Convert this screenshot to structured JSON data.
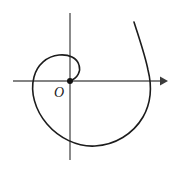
{
  "figure": {
    "background_color": "#ffffff",
    "width": 174,
    "height": 173,
    "origin_label": "O",
    "origin_label_color": "#1a1a1a",
    "curve_color": "#1c1c1c",
    "axis_color": "#5a5a5a",
    "arrow_color": "#3c3c3c"
  },
  "chart_data": {
    "type": "line",
    "xlabel": "",
    "ylabel": "",
    "grid": false,
    "legend": null,
    "origin": {
      "label": "O",
      "x_px": 70,
      "y_px": 81,
      "marker": "filled-dot",
      "marker_radius_px": 3
    },
    "axes": [
      {
        "name": "x-axis",
        "orientation": "horizontal",
        "y_px": 81,
        "x_start_px": 13,
        "x_end_px": 168,
        "arrowhead": "right-end"
      },
      {
        "name": "y-axis",
        "orientation": "vertical",
        "x_px": 70,
        "y_start_px": 13,
        "y_end_px": 160,
        "arrowhead": "none"
      }
    ],
    "series": [
      {
        "name": "spiral",
        "equation": "r = a*theta",
        "direction": "counterclockwise",
        "turns": 1.6,
        "start_point_px": [
          70,
          81
        ],
        "end_point_px": [
          134,
          22
        ],
        "extent_left_px": 27,
        "extent_right_px": 150,
        "extent_top_px": 22,
        "extent_bottom_px": 146,
        "inner_loop_top_px": 59,
        "x_axis_crossing_right_px": 151,
        "path_d": "M 70 81 C 78 78 81 71 79 65 C 77 58 69 54 59 55 C 47 56 37 65 34 77 C 30 92 35 110 47 124 C 59 138 77 147 95 146 C 115 145 133 134 143 117 C 151 103 152 86 148 70 C 145 55 139 38 134 22"
      }
    ]
  }
}
